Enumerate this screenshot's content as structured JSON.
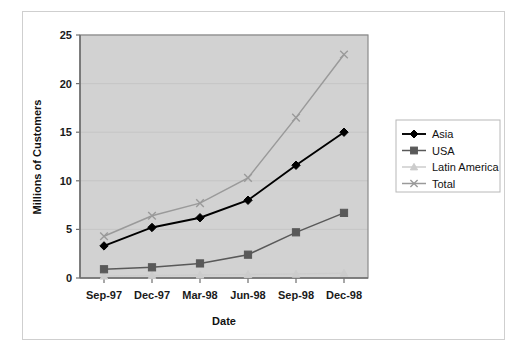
{
  "figure": {
    "background_color": "#ffffff",
    "frame_border_color": "#cfcfcf",
    "plot_background_color": "#d2d2d2",
    "plot_border_color": "#7a7a7a",
    "gridline_color": "#c4c4c4"
  },
  "chart_data": {
    "type": "line",
    "title": "",
    "xlabel": "Date",
    "ylabel": "Millions of Customers",
    "categories": [
      "Sep-97",
      "Dec-97",
      "Mar-98",
      "Jun-98",
      "Sep-98",
      "Dec-98"
    ],
    "ylim": [
      0,
      25
    ],
    "yticks": [
      0,
      5,
      10,
      15,
      20,
      25
    ],
    "grid": true,
    "legend_position": "right",
    "series": [
      {
        "name": "Asia",
        "color": "#000000",
        "marker": "diamond",
        "values": [
          3.3,
          5.2,
          6.2,
          8.0,
          11.6,
          15.0
        ]
      },
      {
        "name": "USA",
        "color": "#595959",
        "marker": "square",
        "values": [
          0.9,
          1.1,
          1.5,
          2.4,
          4.7,
          6.7
        ]
      },
      {
        "name": "Latin America",
        "color": "#cccccc",
        "marker": "triangle",
        "values": [
          0.2,
          0.25,
          0.3,
          0.35,
          0.4,
          0.5
        ]
      },
      {
        "name": "Total",
        "color": "#9a9a9a",
        "marker": "x",
        "values": [
          4.3,
          6.4,
          7.7,
          10.3,
          16.5,
          23.0
        ]
      }
    ]
  },
  "legend": {
    "entries": [
      "Asia",
      "USA",
      "Latin America",
      "Total"
    ]
  }
}
